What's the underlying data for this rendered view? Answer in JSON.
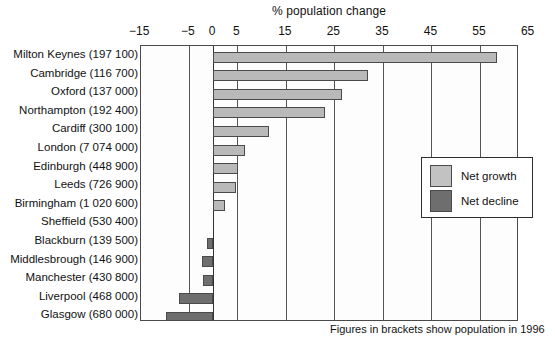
{
  "chart_data": {
    "type": "bar",
    "orientation": "horizontal",
    "title": "% population change",
    "xlabel": "% population change",
    "ylabel": "",
    "xlim": [
      -17.5,
      65
    ],
    "grid": true,
    "xticks": [
      -15,
      -5,
      0,
      5,
      15,
      25,
      35,
      45,
      55,
      65
    ],
    "xtick_labels": [
      "−15",
      "−5",
      "0",
      "5",
      "15",
      "25",
      "35",
      "45",
      "55",
      "65"
    ],
    "categories": [
      "Milton Keynes (197 100)",
      "Cambridge (116 700)",
      "Oxford (137 000)",
      "Northampton (192 400)",
      "Cardiff (300 100)",
      "London (7 074 000)",
      "Edinburgh (448 900)",
      "Leeds (726 900)",
      "Birmingham (1 020 600)",
      "Sheffield (530 400)",
      "Blackburn (139 500)",
      "Middlesbrough (146 900)",
      "Manchester (430 800)",
      "Liverpool (468 000)",
      "Glasgow (680 000)"
    ],
    "values": [
      58.5,
      32,
      26.5,
      23,
      11.5,
      6.5,
      5.2,
      4.7,
      2.5,
      0,
      -1.3,
      -2.2,
      -2,
      -7,
      -9.7
    ],
    "legend": {
      "position": "right-middle",
      "entries": [
        {
          "label": "Net growth",
          "color": "#c2c2c2"
        },
        {
          "label": "Net decline",
          "color": "#6e6e6e"
        }
      ]
    },
    "annotation": "Figures in brackets show population in 1996"
  },
  "chart": {
    "title": "% population change",
    "footnote": "Figures in brackets show population in 1996"
  },
  "legend": {
    "growth_label": "Net growth",
    "decline_label": "Net decline"
  }
}
